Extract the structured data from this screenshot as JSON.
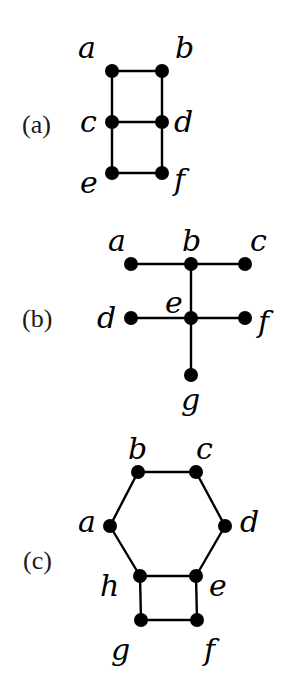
{
  "figure": {
    "background": "#ffffff",
    "ink_color": "#000000",
    "node_radius": 7,
    "panels": [
      {
        "id": "a",
        "label": "(a)",
        "label_pos": [
          22,
          133
        ],
        "nodes": [
          {
            "id": "a",
            "x": 112,
            "y": 71,
            "label": "a",
            "lx": 78,
            "ly": 58
          },
          {
            "id": "b",
            "x": 162,
            "y": 71,
            "label": "b",
            "lx": 175,
            "ly": 58
          },
          {
            "id": "c",
            "x": 112,
            "y": 122,
            "label": "c",
            "lx": 80,
            "ly": 132
          },
          {
            "id": "d",
            "x": 162,
            "y": 122,
            "label": "d",
            "lx": 174,
            "ly": 132
          },
          {
            "id": "e",
            "x": 112,
            "y": 173,
            "label": "e",
            "lx": 80,
            "ly": 193
          },
          {
            "id": "f",
            "x": 162,
            "y": 173,
            "label": "f",
            "lx": 174,
            "ly": 190
          }
        ],
        "edges": [
          [
            "a",
            "b"
          ],
          [
            "a",
            "c"
          ],
          [
            "b",
            "d"
          ],
          [
            "c",
            "d"
          ],
          [
            "c",
            "e"
          ],
          [
            "d",
            "f"
          ],
          [
            "e",
            "f"
          ]
        ]
      },
      {
        "id": "b",
        "label": "(b)",
        "label_pos": [
          22,
          327
        ],
        "nodes": [
          {
            "id": "a",
            "x": 131,
            "y": 264,
            "label": "a",
            "lx": 108,
            "ly": 251
          },
          {
            "id": "b",
            "x": 191,
            "y": 264,
            "label": "b",
            "lx": 182,
            "ly": 251
          },
          {
            "id": "c",
            "x": 245,
            "y": 264,
            "label": "c",
            "lx": 250,
            "ly": 251
          },
          {
            "id": "d",
            "x": 131,
            "y": 318,
            "label": "d",
            "lx": 97,
            "ly": 328
          },
          {
            "id": "e",
            "x": 191,
            "y": 318,
            "label": "e",
            "lx": 165,
            "ly": 313
          },
          {
            "id": "f",
            "x": 245,
            "y": 318,
            "label": "f",
            "lx": 258,
            "ly": 332
          },
          {
            "id": "g",
            "x": 191,
            "y": 375,
            "label": "g",
            "lx": 181,
            "ly": 410
          }
        ],
        "edges": [
          [
            "a",
            "b"
          ],
          [
            "b",
            "c"
          ],
          [
            "b",
            "e"
          ],
          [
            "d",
            "e"
          ],
          [
            "e",
            "f"
          ],
          [
            "e",
            "g"
          ]
        ]
      },
      {
        "id": "c",
        "label": "(c)",
        "label_pos": [
          23,
          569
        ],
        "nodes": [
          {
            "id": "a",
            "x": 110,
            "y": 526,
            "label": "a",
            "lx": 78,
            "ly": 532
          },
          {
            "id": "b",
            "x": 138,
            "y": 472,
            "label": "b",
            "lx": 128,
            "ly": 459
          },
          {
            "id": "c",
            "x": 196,
            "y": 472,
            "label": "c",
            "lx": 196,
            "ly": 459
          },
          {
            "id": "d",
            "x": 225,
            "y": 526,
            "label": "d",
            "lx": 240,
            "ly": 532
          },
          {
            "id": "e",
            "x": 196,
            "y": 576,
            "label": "e",
            "lx": 209,
            "ly": 596
          },
          {
            "id": "f",
            "x": 197,
            "y": 620,
            "label": "f",
            "lx": 204,
            "ly": 660
          },
          {
            "id": "g",
            "x": 141,
            "y": 620,
            "label": "g",
            "lx": 111,
            "ly": 660
          },
          {
            "id": "h",
            "x": 140,
            "y": 576,
            "label": "h",
            "lx": 100,
            "ly": 596
          }
        ],
        "edges": [
          [
            "a",
            "b"
          ],
          [
            "b",
            "c"
          ],
          [
            "c",
            "d"
          ],
          [
            "d",
            "e"
          ],
          [
            "e",
            "h"
          ],
          [
            "h",
            "a"
          ],
          [
            "h",
            "g"
          ],
          [
            "g",
            "f"
          ],
          [
            "f",
            "e"
          ]
        ]
      }
    ]
  }
}
